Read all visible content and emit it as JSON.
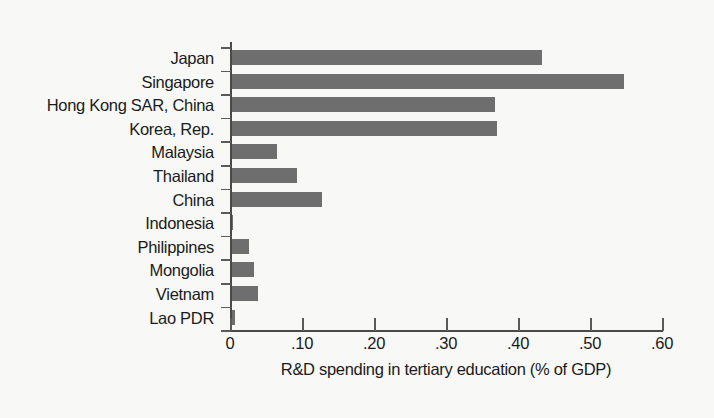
{
  "chart_data": {
    "type": "bar",
    "orientation": "horizontal",
    "title": "",
    "xlabel": "R&D spending in tertiary education (% of GDP)",
    "ylabel": "",
    "xlim": [
      0,
      0.6
    ],
    "xticks": [
      0,
      0.1,
      0.2,
      0.3,
      0.4,
      0.5,
      0.6
    ],
    "xticklabels": [
      "0",
      ".10",
      ".20",
      ".30",
      ".40",
      ".50",
      ".60"
    ],
    "grid": false,
    "legend": null,
    "bar_color": "#6e6e6e",
    "background_color": "#f8f8f6",
    "axis_color": "#4a4a4a",
    "text_color": "#1b1b1b",
    "categories": [
      "Japan",
      "Singapore",
      "Hong Kong SAR, China",
      "Korea, Rep.",
      "Malaysia",
      "Thailand",
      "China",
      "Indonesia",
      "Philippines",
      "Mongolia",
      "Vietnam",
      "Lao PDR"
    ],
    "values": [
      0.43,
      0.545,
      0.365,
      0.368,
      0.062,
      0.09,
      0.125,
      0.002,
      0.024,
      0.03,
      0.036,
      0.004
    ]
  }
}
